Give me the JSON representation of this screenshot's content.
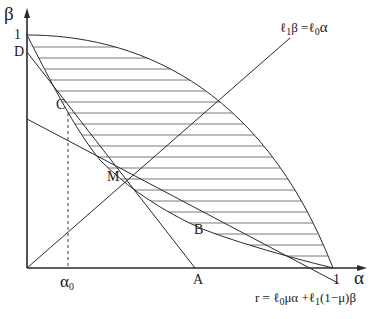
{
  "diagram": {
    "axes": {
      "x_label": "α",
      "y_label": "β",
      "x_tick_one": "1",
      "y_tick_one": "1",
      "x_tick_alpha0": "α",
      "x_tick_alpha0_sub": "0"
    },
    "points": {
      "A": "A",
      "B": "B",
      "C": "C",
      "D": "D",
      "M": "M"
    },
    "equations": {
      "ray": {
        "l1": "ℓ",
        "l1_sub": "1",
        "beta": "β =",
        "l0": "ℓ",
        "l0_sub": "0",
        "alpha": "α"
      },
      "line_r": {
        "prefix": "r = ℓ",
        "sub0": "0",
        "mid": "μα +ℓ",
        "sub1": "1",
        "suffix": "(1−μ)β"
      }
    },
    "colors": {
      "stroke": "#2a2a2a",
      "hatch": "#555555"
    }
  }
}
